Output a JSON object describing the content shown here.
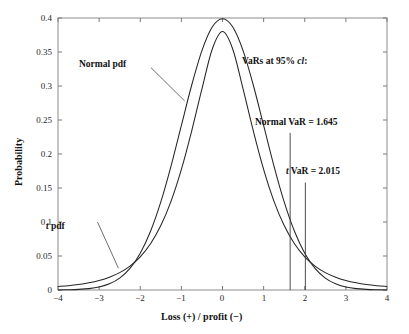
{
  "chart_data": {
    "type": "line",
    "title": "",
    "xlabel": "Loss (+) / profit (−)",
    "ylabel": "Probability",
    "xlim": [
      -4,
      4
    ],
    "ylim": [
      0,
      0.4
    ],
    "grid": false,
    "legend_position": "inline-annotations",
    "x_ticks": [
      "−4",
      "−3",
      "−2",
      "−1",
      "0",
      "1",
      "2",
      "3",
      "4"
    ],
    "x_tick_values": [
      -4,
      -3,
      -2,
      -1,
      0,
      1,
      2,
      3,
      4
    ],
    "y_ticks": [
      "0",
      "0.05",
      "0.1",
      "0.15",
      "0.2",
      "0.25",
      "0.3",
      "0.35",
      "0.4"
    ],
    "y_tick_values": [
      0,
      0.05,
      0.1,
      0.15,
      0.2,
      0.25,
      0.3,
      0.35,
      0.4
    ],
    "series": [
      {
        "name": "Normal pdf",
        "distribution": "standard normal",
        "peak_value": 0.399,
        "x": [
          -4,
          -3.75,
          -3.5,
          -3.25,
          -3,
          -2.75,
          -2.5,
          -2.25,
          -2,
          -1.75,
          -1.5,
          -1.25,
          -1,
          -0.75,
          -0.5,
          -0.25,
          0,
          0.25,
          0.5,
          0.75,
          1,
          1.25,
          1.5,
          1.75,
          2,
          2.25,
          2.5,
          2.75,
          3,
          3.25,
          3.5,
          3.75,
          4
        ],
        "values": [
          0.0001,
          0.0004,
          0.0009,
          0.002,
          0.0044,
          0.0091,
          0.0175,
          0.0317,
          0.054,
          0.0863,
          0.1295,
          0.1826,
          0.242,
          0.3011,
          0.3521,
          0.3867,
          0.3989,
          0.3867,
          0.3521,
          0.3011,
          0.242,
          0.1826,
          0.1295,
          0.0863,
          0.054,
          0.0317,
          0.0175,
          0.0091,
          0.0044,
          0.002,
          0.0009,
          0.0004,
          0.0001
        ]
      },
      {
        "name": "t pdf",
        "distribution": "Student t, fat tails",
        "peak_value": 0.38,
        "x": [
          -4,
          -3.75,
          -3.5,
          -3.25,
          -3,
          -2.75,
          -2.5,
          -2.25,
          -2,
          -1.75,
          -1.5,
          -1.25,
          -1,
          -0.75,
          -0.5,
          -0.25,
          0,
          0.25,
          0.5,
          0.75,
          1,
          1.25,
          1.5,
          1.75,
          2,
          2.25,
          2.5,
          2.75,
          3,
          3.25,
          3.5,
          3.75,
          4
        ],
        "values": [
          0.0051,
          0.0064,
          0.0082,
          0.0107,
          0.0141,
          0.0189,
          0.0256,
          0.0352,
          0.0488,
          0.068,
          0.0947,
          0.1307,
          0.1773,
          0.2337,
          0.2957,
          0.3541,
          0.38,
          0.3541,
          0.2957,
          0.2337,
          0.1773,
          0.1307,
          0.0947,
          0.068,
          0.0488,
          0.0352,
          0.0256,
          0.0189,
          0.0141,
          0.0107,
          0.0082,
          0.0064,
          0.0051
        ]
      }
    ],
    "annotations": [
      {
        "id": "normal-pdf-label",
        "text": "Normal pdf",
        "x_data": -1.74,
        "y_data": 0.327,
        "leader_to_x": -0.92,
        "leader_to_y": 0.278
      },
      {
        "id": "t-pdf-label",
        "text": "t pdf",
        "text_italic_prefix": "t",
        "text_rest": " pdf",
        "x_data": -3.04,
        "y_data": 0.1,
        "leader_to_x": -2.53,
        "leader_to_y": 0.032
      },
      {
        "id": "vars-header",
        "text_plain_1": "VaRs at 95% ",
        "text_italic": "cl",
        "text_plain_2": ":",
        "x_data": 0.85,
        "y_data": 0.335
      },
      {
        "id": "normal-var-label",
        "text": "Normal VaR = 1.645",
        "x_data": 1.18,
        "y_data": 0.245
      },
      {
        "id": "t-var-label",
        "text_italic_prefix": "t",
        "text_rest": " VaR = 2.015",
        "text": "t VaR = 2.015",
        "x_data": 1.92,
        "y_data": 0.173
      }
    ],
    "vertical_markers": [
      {
        "id": "normal-var-line",
        "label": "Normal VaR",
        "x_value": 1.645,
        "y_top": 0.231,
        "y_bottom": 0
      },
      {
        "id": "t-var-line",
        "label": "t VaR",
        "x_value": 2.015,
        "y_top": 0.158,
        "y_bottom": 0
      }
    ]
  }
}
